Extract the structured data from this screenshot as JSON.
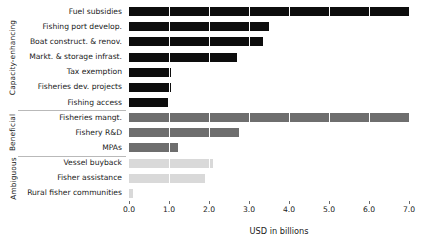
{
  "chart_data": {
    "type": "bar",
    "orientation": "horizontal",
    "title": "",
    "xlabel": "USD in billions",
    "ylabel": "",
    "xlim": [
      0.0,
      7.5
    ],
    "xticks": [
      0.0,
      1.0,
      2.0,
      3.0,
      4.0,
      5.0,
      6.0,
      7.0
    ],
    "xticklabels": [
      "0.0",
      "1.0",
      "2.0",
      "3.0",
      "4.0",
      "5.0",
      "6.0",
      "7.0"
    ],
    "grid": "vertical-white-on-bars",
    "legend": "none",
    "categories": [
      "Fuel subsidies",
      "Fishing port develop.",
      "Boat construct. & renov.",
      "Markt. & storage infrast.",
      "Tax exemption",
      "Fisheries dev. projects",
      "Fishing access",
      "Fisheries mangt.",
      "Fishery R&D",
      "MPAs",
      "Vessel buyback",
      "Fisher assistance",
      "Rural fisher communities"
    ],
    "values": [
      7.0,
      3.5,
      3.35,
      2.7,
      1.05,
      1.05,
      0.98,
      7.0,
      2.75,
      1.22,
      2.1,
      1.9,
      0.1
    ],
    "groups": [
      {
        "name": "Capacity-enhancing",
        "color": "#0d0d0d",
        "count": 7,
        "categories": [
          "Fuel subsidies",
          "Fishing port develop.",
          "Boat construct. & renov.",
          "Markt. & storage infrast.",
          "Tax exemption",
          "Fisheries dev. projects",
          "Fishing access"
        ],
        "values": [
          7.0,
          3.5,
          3.35,
          2.7,
          1.05,
          1.05,
          0.98
        ]
      },
      {
        "name": "Beneficial",
        "color": "#6e6e6e",
        "count": 3,
        "categories": [
          "Fisheries mangt.",
          "Fishery R&D",
          "MPAs"
        ],
        "values": [
          7.0,
          2.75,
          1.22
        ]
      },
      {
        "name": "Ambiguous",
        "color": "#d9d9d9",
        "count": 3,
        "categories": [
          "Vessel buyback",
          "Fisher assistance",
          "Rural fisher communities"
        ],
        "values": [
          2.1,
          1.9,
          0.1
        ]
      }
    ]
  }
}
